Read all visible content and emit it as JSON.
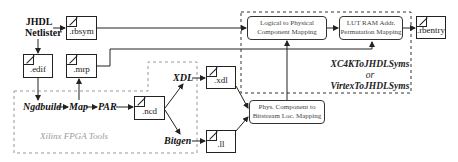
{
  "diagram": {
    "source": {
      "line1": "JHDL",
      "line2": "Netlister"
    },
    "files": {
      "rbsym": ".rbsym",
      "edif": ".edif",
      "mrp": ".mrp",
      "ncd": ".ncd",
      "xdl": ".xdl",
      "ll": ".ll",
      "rbentry": ".rbentry"
    },
    "tools": {
      "ngdbuild": "Ngdbuild",
      "map": "Map",
      "par": "PAR",
      "xdl": "XDL",
      "bitgen": "Bitgen"
    },
    "groups": {
      "xilinx": "Xilinx FPGA Tools",
      "converter_line1": "XC4KToJHDLSyms",
      "converter_line2": "or",
      "converter_line3": "VirtexToJHDLSyms"
    },
    "processes": {
      "logical_to_physical": {
        "line1": "Logical to Physical",
        "line2": "Component Mapping"
      },
      "lut_ram": {
        "line1": "LUT RAM Addr.",
        "line2": "Permutation Mapping"
      },
      "phys_to_bitstream": {
        "line1": "Phys. Component to",
        "line2": "Bitstream Loc. Mapping"
      }
    },
    "colors": {
      "line": "#222222",
      "dashed_group": "#999999",
      "dashed_converter": "#333333",
      "xilinx_label": "#9a9a9a"
    }
  }
}
